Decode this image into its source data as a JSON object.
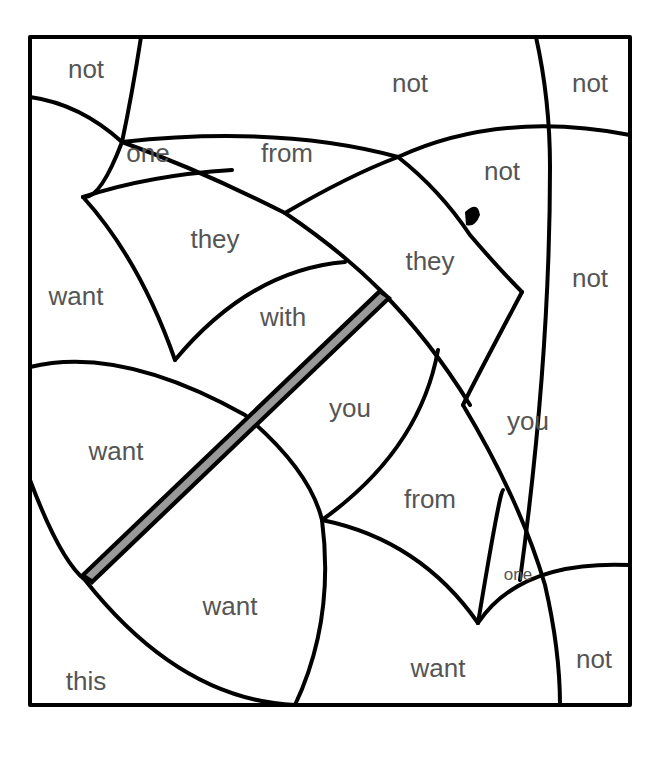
{
  "page": {
    "type": "color-by-word sight word coloring sheet"
  },
  "regions": [
    {
      "word": "not",
      "x": 86,
      "y": 78
    },
    {
      "word": "not",
      "x": 410,
      "y": 92
    },
    {
      "word": "not",
      "x": 590,
      "y": 92
    },
    {
      "word": "one",
      "x": 148,
      "y": 162
    },
    {
      "word": "from",
      "x": 287,
      "y": 162
    },
    {
      "word": "not",
      "x": 502,
      "y": 180
    },
    {
      "word": "they",
      "x": 215,
      "y": 248
    },
    {
      "word": "they",
      "x": 430,
      "y": 270
    },
    {
      "word": "want",
      "x": 76,
      "y": 305
    },
    {
      "word": "not",
      "x": 590,
      "y": 287
    },
    {
      "word": "with",
      "x": 283,
      "y": 326
    },
    {
      "word": "you",
      "x": 350,
      "y": 417
    },
    {
      "word": "you",
      "x": 528,
      "y": 430
    },
    {
      "word": "want",
      "x": 116,
      "y": 460
    },
    {
      "word": "from",
      "x": 430,
      "y": 508
    },
    {
      "word": "one",
      "x": 518,
      "y": 580
    },
    {
      "word": "want",
      "x": 230,
      "y": 615
    },
    {
      "word": "want",
      "x": 438,
      "y": 677
    },
    {
      "word": "not",
      "x": 594,
      "y": 668
    },
    {
      "word": "this",
      "x": 86,
      "y": 690
    }
  ]
}
